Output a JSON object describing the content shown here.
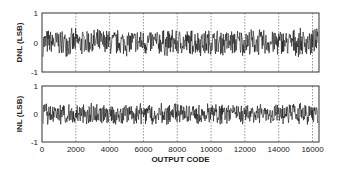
{
  "chart_data": [
    {
      "type": "line",
      "name": "DNL",
      "title": "",
      "xlabel": "",
      "ylabel": "DNL (LSB)",
      "xlim": [
        0,
        16384
      ],
      "ylim": [
        -1,
        1
      ],
      "yticks": [
        "1",
        "0",
        "-1"
      ],
      "xticks": [
        0,
        2000,
        4000,
        6000,
        8000,
        10000,
        12000,
        14000,
        16000
      ],
      "grid": "vertical dashed at x ticks",
      "series": [
        {
          "name": "DNL",
          "description": "noise-like trace",
          "amplitude_range": [
            -0.5,
            0.5
          ],
          "seed": 7
        }
      ]
    },
    {
      "type": "line",
      "name": "INL",
      "title": "",
      "xlabel": "OUTPUT CODE",
      "ylabel": "INL (LSB)",
      "xlim": [
        0,
        16384
      ],
      "ylim": [
        -1,
        1
      ],
      "yticks": [
        "1",
        "0",
        "-1"
      ],
      "xticks": [
        0,
        2000,
        4000,
        6000,
        8000,
        10000,
        12000,
        14000,
        16000
      ],
      "xticklabels": [
        "0",
        "2000",
        "4000",
        "6000",
        "8000",
        "10000",
        "12000",
        "14000",
        "16000"
      ],
      "grid": "vertical dashed at x ticks",
      "series": [
        {
          "name": "INL",
          "description": "noise-like trace",
          "amplitude_range": [
            -0.4,
            0.4
          ],
          "seed": 13
        }
      ]
    }
  ]
}
